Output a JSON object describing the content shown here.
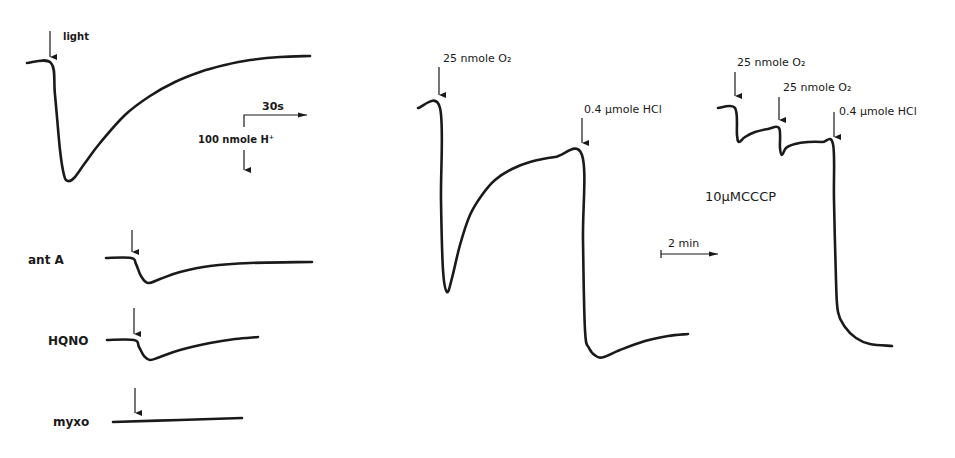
{
  "chart_data": {
    "type": "line",
    "title": "",
    "colors": {
      "trace": "#1a1a1a",
      "background": "#ffffff"
    },
    "panels": [
      {
        "id": "light-control",
        "label": "",
        "trigger_label": "light",
        "trigger": {
          "x": 50,
          "y1": 31,
          "y2": 57,
          "label_x": 63,
          "label_y": 40
        },
        "points": [
          [
            27,
            63
          ],
          [
            51,
            63
          ],
          [
            55,
            95
          ],
          [
            60,
            150
          ],
          [
            64,
            175
          ],
          [
            68,
            181
          ],
          [
            74,
            178
          ],
          [
            85,
            163
          ],
          [
            100,
            143
          ],
          [
            125,
            115
          ],
          [
            150,
            96
          ],
          [
            175,
            82
          ],
          [
            200,
            72
          ],
          [
            225,
            65
          ],
          [
            250,
            60
          ],
          [
            280,
            57
          ],
          [
            310,
            56
          ]
        ]
      },
      {
        "id": "ant-a",
        "label": "ant A",
        "label_pos": {
          "x": 28,
          "y": 264
        },
        "trigger": {
          "x": 132,
          "y1": 230,
          "y2": 252
        },
        "points": [
          [
            106,
            258
          ],
          [
            131,
            258
          ],
          [
            136,
            264
          ],
          [
            141,
            276
          ],
          [
            148,
            283
          ],
          [
            160,
            279
          ],
          [
            180,
            272
          ],
          [
            210,
            266
          ],
          [
            250,
            263
          ],
          [
            312,
            262
          ]
        ]
      },
      {
        "id": "hqno",
        "label": "HQNO",
        "label_pos": {
          "x": 48,
          "y": 345
        },
        "trigger": {
          "x": 134,
          "y1": 308,
          "y2": 334
        },
        "points": [
          [
            107,
            340
          ],
          [
            134,
            340
          ],
          [
            139,
            347
          ],
          [
            144,
            356
          ],
          [
            150,
            360
          ],
          [
            160,
            357
          ],
          [
            180,
            350
          ],
          [
            210,
            343
          ],
          [
            235,
            339
          ],
          [
            258,
            337
          ]
        ]
      },
      {
        "id": "myxo",
        "label": "myxo",
        "label_pos": {
          "x": 53,
          "y": 426
        },
        "trigger": {
          "x": 135,
          "y1": 388,
          "y2": 413
        },
        "points": [
          [
            113,
            422
          ],
          [
            180,
            420
          ],
          [
            242,
            418
          ]
        ]
      },
      {
        "id": "o2-pulse",
        "label": "",
        "triggers": [
          {
            "label": "25 nmole O₂",
            "x": 439,
            "y1": 67,
            "y2": 95,
            "label_x": 443,
            "label_y": 62
          },
          {
            "label": "0.4 µmole HCl",
            "x": 582,
            "y1": 118,
            "y2": 143,
            "label_x": 584,
            "label_y": 113
          }
        ],
        "points": [
          [
            418,
            108
          ],
          [
            440,
            108
          ],
          [
            441,
            200
          ],
          [
            443,
            270
          ],
          [
            447,
            292
          ],
          [
            452,
            278
          ],
          [
            460,
            245
          ],
          [
            470,
            215
          ],
          [
            482,
            195
          ],
          [
            495,
            180
          ],
          [
            512,
            169
          ],
          [
            530,
            162
          ],
          [
            555,
            157
          ],
          [
            582,
            155
          ],
          [
            583,
            240
          ],
          [
            585,
            330
          ],
          [
            589,
            348
          ],
          [
            596,
            356
          ],
          [
            604,
            357
          ],
          [
            620,
            350
          ],
          [
            645,
            341
          ],
          [
            668,
            336
          ],
          [
            688,
            334
          ]
        ]
      },
      {
        "id": "cccp",
        "label": "10µMCCCP",
        "label_pos": {
          "x": 705,
          "y": 201
        },
        "triggers": [
          {
            "label": "25 nmole O₂",
            "x": 735,
            "y1": 72,
            "y2": 96,
            "label_x": 737,
            "label_y": 66
          },
          {
            "label": "25 nmole O₂",
            "x": 779,
            "y1": 97,
            "y2": 120,
            "label_x": 783,
            "label_y": 91
          },
          {
            "label": "0.4 µmole HCl",
            "x": 834,
            "y1": 112,
            "y2": 137,
            "label_x": 839,
            "label_y": 115
          }
        ],
        "points": [
          [
            718,
            108
          ],
          [
            735,
            108
          ],
          [
            737,
            135
          ],
          [
            739,
            142
          ],
          [
            745,
            137
          ],
          [
            755,
            132
          ],
          [
            768,
            129
          ],
          [
            779,
            128
          ],
          [
            780,
            148
          ],
          [
            782,
            155
          ],
          [
            786,
            148
          ],
          [
            795,
            144
          ],
          [
            808,
            142
          ],
          [
            822,
            142
          ],
          [
            833,
            144
          ],
          [
            834,
            200
          ],
          [
            836,
            280
          ],
          [
            838,
            312
          ],
          [
            845,
            327
          ],
          [
            856,
            338
          ],
          [
            870,
            344
          ],
          [
            892,
            346
          ]
        ]
      }
    ],
    "scale_bars": [
      {
        "id": "scale-30s-100nmol",
        "time_label": "30s",
        "amount_label": "100 nmole H⁺",
        "corner": {
          "x": 244,
          "y": 115
        },
        "time_end_x": 307,
        "amount_top_y": 127,
        "amount_arrow": {
          "y1": 150,
          "y2": 170
        },
        "time_label_pos": {
          "x": 262,
          "y": 110
        },
        "amount_label_pos": {
          "x": 198,
          "y": 143
        }
      },
      {
        "id": "scale-2min",
        "time_label": "2 min",
        "x1": 661,
        "x2": 718,
        "y": 254,
        "time_label_pos": {
          "x": 668,
          "y": 247
        }
      }
    ]
  }
}
